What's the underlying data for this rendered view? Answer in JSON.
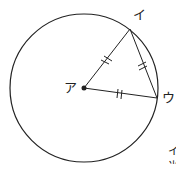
{
  "diagram": {
    "type": "circle-geometry",
    "circle": {
      "cx": 84,
      "cy": 88,
      "r": 74
    },
    "points": [
      {
        "id": "center",
        "label": "ア",
        "x": 84,
        "y": 88
      },
      {
        "id": "top",
        "label": "イ",
        "x": 130,
        "y": 29
      },
      {
        "id": "right",
        "label": "ウ",
        "x": 157,
        "y": 98
      }
    ],
    "segments": [
      {
        "from": "center",
        "to": "top",
        "tick": "double"
      },
      {
        "from": "top",
        "to": "right",
        "tick": "double"
      },
      {
        "from": "center",
        "to": "right",
        "tick": "double"
      }
    ],
    "cut_text": [
      "イ",
      "⺌"
    ],
    "stroke_color": "#222222"
  }
}
